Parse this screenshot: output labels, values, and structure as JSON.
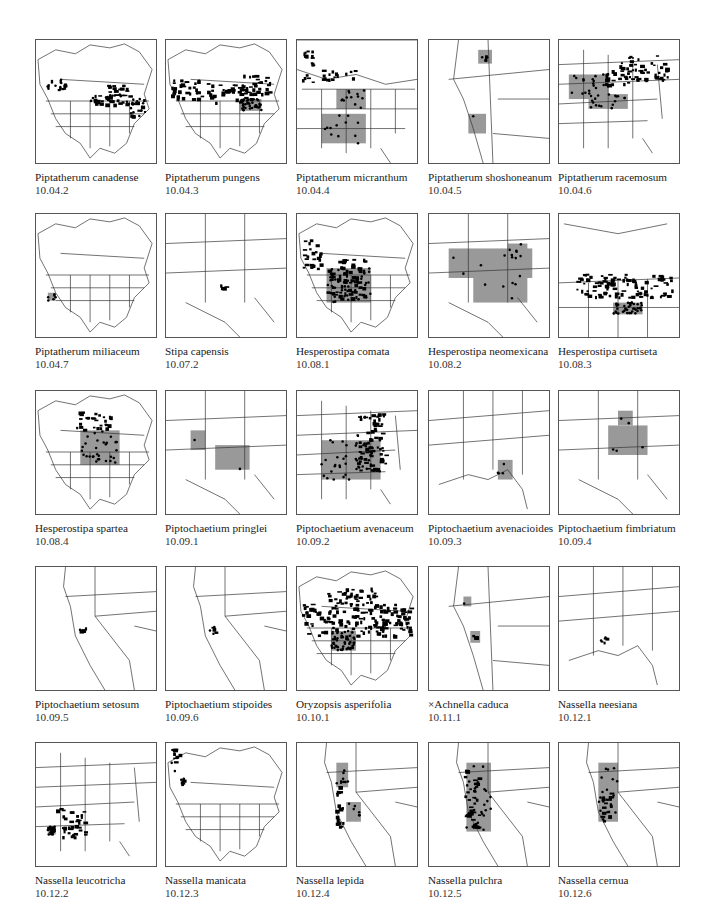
{
  "page": {
    "page_number": "",
    "colors": {
      "outline": "#333333",
      "range_fill": "#999999",
      "occurrence_dot": "#000000",
      "frame": "#555555"
    }
  },
  "maps": [
    {
      "name": "Piptatherum canadense",
      "code": "10.04.2",
      "extent": "continent",
      "gray": [],
      "black": [
        [
          10,
          40,
          20,
          10
        ],
        [
          55,
          55,
          35,
          12
        ],
        [
          70,
          45,
          25,
          20
        ],
        [
          95,
          60,
          15,
          18
        ]
      ],
      "dots": 40
    },
    {
      "name": "Piptatherum pungens",
      "code": "10.04.3",
      "extent": "continent",
      "gray": [
        [
          75,
          60,
          22,
          12
        ]
      ],
      "black": [
        [
          5,
          40,
          45,
          20
        ],
        [
          40,
          45,
          50,
          18
        ],
        [
          75,
          35,
          30,
          20
        ]
      ],
      "dots": 35
    },
    {
      "name": "Piptatherum micranthum",
      "code": "10.04.4",
      "extent": "west",
      "gray": [
        [
          40,
          50,
          30,
          20
        ],
        [
          25,
          75,
          45,
          30
        ]
      ],
      "black": [
        [
          5,
          5,
          10,
          40
        ],
        [
          25,
          30,
          40,
          10
        ]
      ],
      "dots": 25
    },
    {
      "name": "Piptatherum shoshoneanum",
      "code": "10.04.5",
      "extent": "greatbasin",
      "gray": [
        [
          50,
          10,
          14,
          14
        ],
        [
          40,
          75,
          18,
          20
        ]
      ],
      "black": [
        [
          55,
          15,
          5,
          5
        ]
      ],
      "dots": 2
    },
    {
      "name": "Piptatherum racemosum",
      "code": "10.04.6",
      "extent": "east",
      "gray": [
        [
          10,
          35,
          40,
          25
        ],
        [
          30,
          55,
          40,
          15
        ]
      ],
      "black": [
        [
          60,
          15,
          50,
          25
        ],
        [
          40,
          30,
          30,
          15
        ]
      ],
      "dots": 35
    },
    {
      "name": "Piptatherum miliaceum",
      "code": "10.04.7",
      "extent": "continent",
      "gray": [
        [
          12,
          80,
          8,
          8
        ]
      ],
      "black": [],
      "dots": 6
    },
    {
      "name": "Stipa capensis",
      "code": "10.07.2",
      "extent": "southwest",
      "gray": [],
      "black": [
        [
          55,
          70,
          5,
          5
        ]
      ],
      "dots": 1
    },
    {
      "name": "Hesperostipa comata",
      "code": "10.08.1",
      "extent": "continent",
      "gray": [
        [
          30,
          55,
          45,
          35
        ]
      ],
      "black": [
        [
          5,
          25,
          20,
          30
        ],
        [
          30,
          45,
          40,
          40
        ]
      ],
      "dots": 45
    },
    {
      "name": "Hesperostipa neomexicana",
      "code": "10.08.2",
      "extent": "southwest",
      "gray": [
        [
          20,
          35,
          85,
          30
        ],
        [
          45,
          60,
          55,
          30
        ],
        [
          80,
          30,
          20,
          15
        ]
      ],
      "black": [],
      "dots": 18
    },
    {
      "name": "Hesperostipa curtiseta",
      "code": "10.08.3",
      "extent": "plains",
      "gray": [
        [
          55,
          90,
          30,
          12
        ]
      ],
      "black": [
        [
          15,
          60,
          100,
          25
        ]
      ],
      "dots": 40
    },
    {
      "name": "Hesperostipa spartea",
      "code": "10.08.4",
      "extent": "continent",
      "gray": [
        [
          45,
          40,
          40,
          35
        ]
      ],
      "black": [
        [
          40,
          20,
          35,
          20
        ]
      ],
      "dots": 30
    },
    {
      "name": "Piptochaetium pringlei",
      "code": "10.09.1",
      "extent": "southwest",
      "gray": [
        [
          25,
          40,
          15,
          20
        ],
        [
          50,
          55,
          35,
          25
        ]
      ],
      "black": [],
      "dots": 2
    },
    {
      "name": "Piptochaetium avenaceum",
      "code": "10.09.2",
      "extent": "east",
      "gray": [
        [
          25,
          50,
          60,
          40
        ]
      ],
      "black": [
        [
          60,
          20,
          30,
          60
        ]
      ],
      "dots": 40
    },
    {
      "name": "Piptochaetium avenacioides",
      "code": "10.09.3",
      "extent": "southeast",
      "gray": [
        [
          70,
          70,
          15,
          20
        ]
      ],
      "black": [],
      "dots": 4
    },
    {
      "name": "Piptochaetium fimbriatum",
      "code": "10.09.4",
      "extent": "southwest",
      "gray": [
        [
          50,
          35,
          40,
          30
        ],
        [
          60,
          20,
          15,
          15
        ]
      ],
      "black": [],
      "dots": 5
    },
    {
      "name": "Piptochaetium setosum",
      "code": "10.09.5",
      "extent": "california",
      "gray": [],
      "black": [
        [
          44,
          60,
          6,
          8
        ]
      ],
      "dots": 2
    },
    {
      "name": "Piptochaetium stipoides",
      "code": "10.09.6",
      "extent": "california",
      "gray": [],
      "black": [
        [
          44,
          60,
          6,
          8
        ]
      ],
      "dots": 2
    },
    {
      "name": "Oryzopsis asperifolia",
      "code": "10.10.1",
      "extent": "continent",
      "gray": [
        [
          35,
          65,
          25,
          20
        ]
      ],
      "black": [
        [
          5,
          35,
          110,
          35
        ],
        [
          30,
          20,
          50,
          15
        ]
      ],
      "dots": 50
    },
    {
      "name": "×Achnella caduca",
      "code": "10.11.1",
      "extent": "greatbasin",
      "gray": [
        [
          35,
          30,
          8,
          10
        ],
        [
          42,
          65,
          10,
          12
        ]
      ],
      "black": [
        [
          44,
          68,
          3,
          3
        ]
      ],
      "dots": 1
    },
    {
      "name": "Nassella neesiana",
      "code": "10.12.1",
      "extent": "southeast",
      "gray": [],
      "black": [
        [
          42,
          70,
          10,
          6
        ]
      ],
      "dots": 2
    },
    {
      "name": "Nassella leucotricha",
      "code": "10.12.2",
      "extent": "east",
      "gray": [
        [
          12,
          85,
          8,
          8
        ]
      ],
      "black": [
        [
          20,
          65,
          30,
          30
        ]
      ],
      "dots": 30
    },
    {
      "name": "Nassella manicata",
      "code": "10.12.3",
      "extent": "continent",
      "gray": [],
      "black": [
        [
          5,
          5,
          8,
          25
        ],
        [
          15,
          35,
          4,
          6
        ]
      ],
      "dots": 6
    },
    {
      "name": "Nassella lepida",
      "code": "10.12.4",
      "extent": "california",
      "gray": [
        [
          40,
          20,
          12,
          25
        ],
        [
          50,
          60,
          15,
          20
        ]
      ],
      "black": [
        [
          38,
          25,
          8,
          60
        ]
      ],
      "dots": 12
    },
    {
      "name": "Nassella pulchra",
      "code": "10.12.5",
      "extent": "california",
      "gray": [
        [
          38,
          20,
          25,
          70
        ]
      ],
      "black": [
        [
          35,
          25,
          15,
          60
        ]
      ],
      "dots": 25
    },
    {
      "name": "Nassella cernua",
      "code": "10.12.6",
      "extent": "california",
      "gray": [
        [
          40,
          20,
          20,
          60
        ]
      ],
      "black": [
        [
          40,
          50,
          12,
          35
        ]
      ],
      "dots": 15
    }
  ]
}
